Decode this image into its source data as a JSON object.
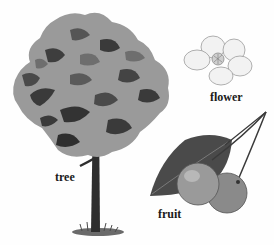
{
  "figure": {
    "labels": {
      "tree": "tree",
      "flower": "flower",
      "fruit": "fruit"
    },
    "colors": {
      "background": "#fefefe",
      "foliage_light": "#9a9a9a",
      "foliage_mid": "#6e6e6e",
      "foliage_dark": "#3a3a3a",
      "trunk": "#2e2e2e",
      "flower_petal": "#f2f2f2",
      "flower_outline": "#9c9c9c",
      "fruit": "#8a8a8a",
      "leaf": "#4a4a4a",
      "label_text": "#1a1a1a"
    }
  }
}
